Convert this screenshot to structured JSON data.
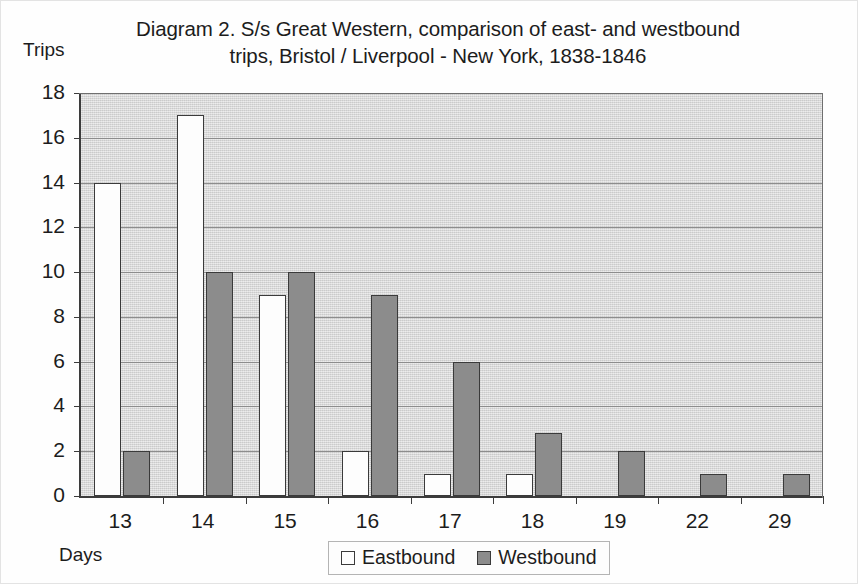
{
  "figure": {
    "title_line1": "Diagram 2. S/s Great Western, comparison of east- and westbound",
    "title_line2": "trips, Bristol / Liverpool - New York, 1838-1846",
    "y_axis_title": "Trips",
    "x_axis_title": "Days"
  },
  "legend": {
    "eastbound_label": "Eastbound",
    "westbound_label": "Westbound"
  },
  "colors": {
    "eastbound_fill": "#fdfdfd",
    "westbound_fill": "#8c8c8c",
    "bar_outline": "#3a3a3a",
    "plot_background": "#dcdcdc",
    "gridline": "#8d8d8d",
    "axis": "#3c3c3c"
  },
  "chart_data": {
    "type": "bar",
    "title": "Diagram 2. S/s Great Western, comparison of east- and westbound trips, Bristol / Liverpool - New York, 1838-1846",
    "xlabel": "Days",
    "ylabel": "Trips",
    "categories": [
      "13",
      "14",
      "15",
      "16",
      "17",
      "18",
      "19",
      "22",
      "29"
    ],
    "series": [
      {
        "name": "Eastbound",
        "values": [
          14,
          17,
          9,
          2,
          1,
          1,
          0,
          0,
          0
        ]
      },
      {
        "name": "Westbound",
        "values": [
          2,
          10,
          10,
          9,
          6,
          2.8,
          2,
          1,
          1
        ]
      }
    ],
    "ylim": [
      0,
      18
    ],
    "ytick_labels": [
      "0",
      "2",
      "4",
      "6",
      "8",
      "10",
      "12",
      "14",
      "16",
      "18"
    ],
    "ytick_values": [
      0,
      2,
      4,
      6,
      8,
      10,
      12,
      14,
      16,
      18
    ],
    "grid": true,
    "legend_position": "bottom-center"
  }
}
